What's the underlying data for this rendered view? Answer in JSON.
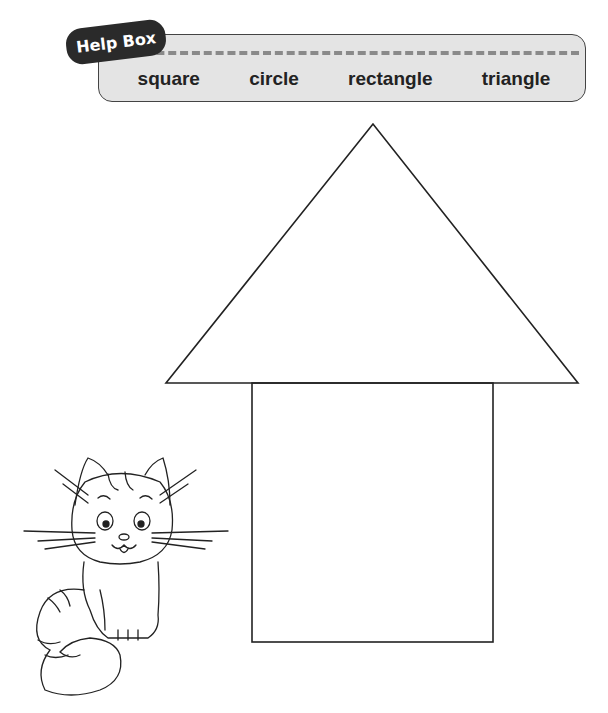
{
  "help_box": {
    "title": "Help Box",
    "words": [
      "square",
      "circle",
      "rectangle",
      "triangle"
    ]
  },
  "drawing": {
    "shapes": [
      {
        "type": "triangle",
        "label": "roof"
      },
      {
        "type": "rectangle",
        "label": "house-body"
      }
    ],
    "illustration": "cat"
  },
  "colors": {
    "line": "#222222",
    "helpbox_bg": "#e4e4e4",
    "tag_bg": "#2a2a2a"
  }
}
